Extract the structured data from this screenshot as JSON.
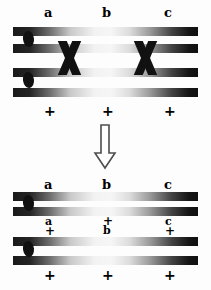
{
  "diagram": {
    "gene_labels": [
      "a",
      "b",
      "c"
    ],
    "wildtype_symbol": "+",
    "colors": {
      "bar_dark": "#111111",
      "bar_light": "#f4f4f4",
      "centromere": "#111111",
      "crossover": "#111111",
      "background": "#fdfdfd",
      "arrow_outline": "#555555"
    },
    "top_group": {
      "name": "tetrad-before-crossover",
      "top_labels": [
        {
          "text": "a",
          "x": 46,
          "y": 8
        },
        {
          "text": "b",
          "x": 104,
          "y": 8
        },
        {
          "text": "c",
          "x": 166,
          "y": 8
        }
      ],
      "bottom_labels": [
        {
          "text": "+",
          "x": 46,
          "y": 108
        },
        {
          "text": "+",
          "x": 104,
          "y": 108
        },
        {
          "text": "+",
          "x": 166,
          "y": 108
        }
      ],
      "chromatids": [
        {
          "name": "chromatid-1",
          "y": 28,
          "x": 13,
          "w": 185
        },
        {
          "name": "chromatid-2",
          "y": 45,
          "x": 13,
          "w": 185
        },
        {
          "name": "chromatid-3",
          "y": 68,
          "x": 13,
          "w": 185
        },
        {
          "name": "chromatid-4",
          "y": 88,
          "x": 13,
          "w": 185
        }
      ],
      "centromeres": [
        {
          "name": "centromere-upper",
          "x": 22,
          "y": 32
        },
        {
          "name": "centromere-lower",
          "x": 22,
          "y": 74
        }
      ],
      "crossovers": [
        {
          "name": "crossover-left",
          "x": 54,
          "y": 42
        },
        {
          "name": "crossover-right",
          "x": 130,
          "y": 42
        }
      ]
    },
    "arrow": {
      "name": "process-arrow",
      "direction": "down",
      "x": 92,
      "y": 125,
      "w": 24,
      "h": 45
    },
    "bottom_group_upper": {
      "name": "recombinant-chromatid-pair-upper",
      "top_labels": [
        {
          "text": "a",
          "x": 46,
          "y": 182
        },
        {
          "text": "b",
          "x": 104,
          "y": 182
        },
        {
          "text": "c",
          "x": 166,
          "y": 182
        }
      ],
      "bottom_labels": [
        {
          "text": "a",
          "x": 46,
          "y": 212
        },
        {
          "text": "+",
          "x": 104,
          "y": 212
        },
        {
          "text": "c",
          "x": 166,
          "y": 212
        }
      ],
      "chromatids": [
        {
          "name": "chromatid-5",
          "y": 193,
          "x": 13,
          "w": 185
        },
        {
          "name": "chromatid-6",
          "y": 207,
          "x": 13,
          "w": 185
        }
      ],
      "centromeres": [
        {
          "name": "centromere-upper-2",
          "x": 22,
          "y": 195
        }
      ]
    },
    "bottom_group_lower": {
      "name": "recombinant-chromatid-pair-lower",
      "top_labels": [
        {
          "text": "+",
          "x": 46,
          "y": 224
        },
        {
          "text": "b",
          "x": 104,
          "y": 224
        },
        {
          "text": "+",
          "x": 166,
          "y": 224
        }
      ],
      "bottom_labels": [
        {
          "text": "+",
          "x": 46,
          "y": 268
        },
        {
          "text": "+",
          "x": 104,
          "y": 268
        },
        {
          "text": "+",
          "x": 166,
          "y": 268
        }
      ],
      "chromatids": [
        {
          "name": "chromatid-7",
          "y": 238,
          "x": 13,
          "w": 185
        },
        {
          "name": "chromatid-8",
          "y": 256,
          "x": 13,
          "w": 185
        }
      ],
      "centromeres": [
        {
          "name": "centromere-lower-2",
          "x": 22,
          "y": 241
        }
      ]
    }
  }
}
